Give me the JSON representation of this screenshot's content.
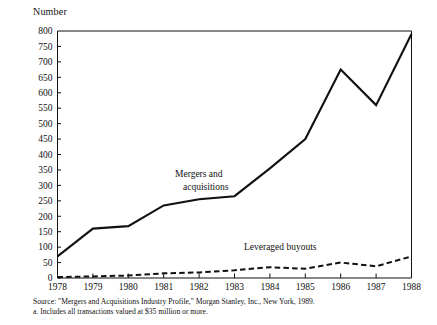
{
  "figure": {
    "y_axis_unit_label": "Number",
    "source_note": "Source: \"Mergers and Acquisitions Industry Profile,\" Morgan Stanley, Inc., New York, 1989.",
    "footnote": "a. Includes all transactions valued at $35 million or more."
  },
  "chart_data": {
    "type": "line",
    "title": "",
    "xlabel": "",
    "ylabel": "Number",
    "categories": [
      "1978",
      "1979",
      "1980",
      "1981",
      "1982",
      "1983",
      "1984",
      "1985",
      "1986",
      "1987",
      "1988"
    ],
    "x": [
      1978,
      1979,
      1980,
      1981,
      1982,
      1983,
      1984,
      1985,
      1986,
      1987,
      1988
    ],
    "ylim": [
      0,
      800
    ],
    "ytick_values": [
      0,
      50,
      100,
      150,
      200,
      250,
      300,
      350,
      400,
      450,
      500,
      550,
      600,
      650,
      700,
      750,
      800
    ],
    "ytick_labels": [
      "0",
      "50",
      "100",
      "150",
      "200",
      "250",
      "300",
      "350",
      "400",
      "450",
      "500",
      "550",
      "600",
      "650",
      "700",
      "750",
      "800"
    ],
    "grid": false,
    "legend": "inline-annotations",
    "series": [
      {
        "name": "Mergers and acquisitions",
        "style": "solid",
        "color": "#111111",
        "label_text_line1": "Mergers and",
        "label_text_line2": "acquisitions",
        "values": [
          70,
          160,
          168,
          235,
          255,
          265,
          355,
          450,
          675,
          560,
          790
        ]
      },
      {
        "name": "Leveraged buyouts",
        "style": "dashed",
        "color": "#111111",
        "label_text_line1": "Leveraged buyouts",
        "label_text_line2": "",
        "values": [
          3,
          5,
          8,
          15,
          18,
          25,
          35,
          30,
          50,
          38,
          70
        ]
      }
    ]
  }
}
